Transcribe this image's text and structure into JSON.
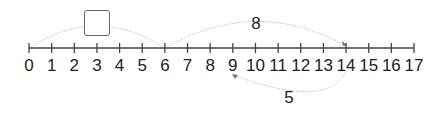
{
  "number_line": {
    "min": 0,
    "max": 17,
    "ticks": [
      "0",
      "1",
      "2",
      "3",
      "4",
      "5",
      "6",
      "7",
      "8",
      "9",
      "10",
      "11",
      "12",
      "13",
      "14",
      "15",
      "16",
      "17"
    ]
  },
  "jumps": [
    {
      "from": 0,
      "to": 6,
      "side": "above",
      "label": "",
      "has_answer_box": true
    },
    {
      "from": 6,
      "to": 14,
      "side": "above",
      "label": "8"
    },
    {
      "from": 14,
      "to": 9,
      "side": "below",
      "label": "5"
    }
  ],
  "labels": {
    "jump_8": "8",
    "jump_5": "5"
  },
  "colors": {
    "line": "#444444",
    "arc": "#bbbbbb",
    "text": "#222222",
    "box_border": "#666666"
  }
}
